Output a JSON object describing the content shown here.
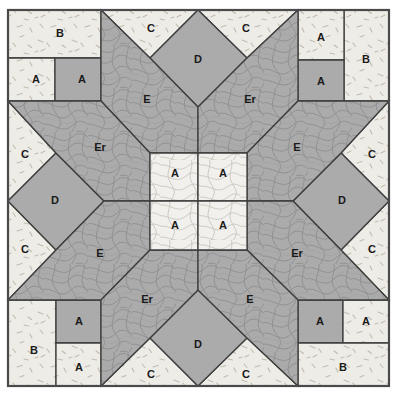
{
  "diagram": {
    "type": "quilt-block",
    "symmetry": "4-fold rotational",
    "canvas": {
      "width": 400,
      "height": 400,
      "background": "#ffffff"
    },
    "frame": {
      "x": 7,
      "y": 9,
      "width": 383,
      "height": 378,
      "border_color": "#4a4a4a",
      "border_width": 2
    },
    "palette": {
      "light_fleck": "#eceae4",
      "light_swirl": "#efefef",
      "medium_gray": "#ababab",
      "gray_swirl": "#a9a9a9",
      "seam_line": "#3d3d3d",
      "label_color": "#1a1a1a"
    },
    "legend": {
      "A": "small square",
      "B": "rectangle",
      "C": "corner triangle",
      "D": "edge diamond",
      "E": "star kite",
      "Er": "star kite reversed"
    }
  },
  "pieces": [
    {
      "id": "c1-b",
      "label": "B",
      "fabric": "light_fleck",
      "unit": "corner-top-left",
      "lx": 60,
      "ly": 34
    },
    {
      "id": "c1-a1",
      "label": "A",
      "fabric": "light_fleck",
      "unit": "corner-top-left",
      "lx": 36,
      "ly": 80
    },
    {
      "id": "c1-a2",
      "label": "A",
      "fabric": "medium_gray",
      "unit": "corner-top-left",
      "lx": 82,
      "ly": 80
    },
    {
      "id": "c2-a1",
      "label": "A",
      "fabric": "light_fleck",
      "unit": "corner-top-right",
      "lx": 321,
      "ly": 38
    },
    {
      "id": "c2-a2",
      "label": "A",
      "fabric": "medium_gray",
      "unit": "corner-top-right",
      "lx": 321,
      "ly": 82
    },
    {
      "id": "c2-b",
      "label": "B",
      "fabric": "light_fleck",
      "unit": "corner-top-right",
      "lx": 366,
      "ly": 60
    },
    {
      "id": "c3-b",
      "label": "B",
      "fabric": "light_fleck",
      "unit": "corner-bottom-left",
      "lx": 34,
      "ly": 351
    },
    {
      "id": "c3-a1",
      "label": "A",
      "fabric": "medium_gray",
      "unit": "corner-bottom-left",
      "lx": 79,
      "ly": 322
    },
    {
      "id": "c3-a2",
      "label": "A",
      "fabric": "light_fleck",
      "unit": "corner-bottom-left",
      "lx": 79,
      "ly": 368
    },
    {
      "id": "c4-a1",
      "label": "A",
      "fabric": "medium_gray",
      "unit": "corner-bottom-right",
      "lx": 320,
      "ly": 322
    },
    {
      "id": "c4-a2",
      "label": "A",
      "fabric": "light_fleck",
      "unit": "corner-bottom-right",
      "lx": 366,
      "ly": 322
    },
    {
      "id": "c4-b",
      "label": "B",
      "fabric": "light_fleck",
      "unit": "corner-bottom-right",
      "lx": 343,
      "ly": 368
    },
    {
      "id": "ct-l",
      "label": "C",
      "fabric": "light_fleck",
      "unit": "edge-top",
      "lx": 151,
      "ly": 29
    },
    {
      "id": "ct-r",
      "label": "C",
      "fabric": "light_fleck",
      "unit": "edge-top",
      "lx": 246,
      "ly": 29
    },
    {
      "id": "d-top",
      "label": "D",
      "fabric": "medium_gray",
      "unit": "edge-top",
      "lx": 198,
      "ly": 60
    },
    {
      "id": "cl-t",
      "label": "C",
      "fabric": "light_fleck",
      "unit": "edge-left",
      "lx": 25,
      "ly": 155
    },
    {
      "id": "cl-b",
      "label": "C",
      "fabric": "light_fleck",
      "unit": "edge-left",
      "lx": 25,
      "ly": 250
    },
    {
      "id": "d-left",
      "label": "D",
      "fabric": "medium_gray",
      "unit": "edge-left",
      "lx": 55,
      "ly": 201
    },
    {
      "id": "cr-t",
      "label": "C",
      "fabric": "light_fleck",
      "unit": "edge-right",
      "lx": 372,
      "ly": 155
    },
    {
      "id": "cr-b",
      "label": "C",
      "fabric": "light_fleck",
      "unit": "edge-right",
      "lx": 372,
      "ly": 250
    },
    {
      "id": "d-right",
      "label": "D",
      "fabric": "medium_gray",
      "unit": "edge-right",
      "lx": 342,
      "ly": 201
    },
    {
      "id": "cb-l",
      "label": "C",
      "fabric": "light_fleck",
      "unit": "edge-bottom",
      "lx": 151,
      "ly": 375
    },
    {
      "id": "cb-r",
      "label": "C",
      "fabric": "light_fleck",
      "unit": "edge-bottom",
      "lx": 246,
      "ly": 375
    },
    {
      "id": "d-bot",
      "label": "D",
      "fabric": "medium_gray",
      "unit": "edge-bottom",
      "lx": 198,
      "ly": 345
    },
    {
      "id": "e-tl",
      "label": "E",
      "fabric": "gray_swirl",
      "unit": "star-point",
      "lx": 147,
      "ly": 100
    },
    {
      "id": "er-tr",
      "label": "Er",
      "fabric": "gray_swirl",
      "unit": "star-point",
      "lx": 250,
      "ly": 100
    },
    {
      "id": "er-lt",
      "label": "Er",
      "fabric": "gray_swirl",
      "unit": "star-point",
      "lx": 100,
      "ly": 148
    },
    {
      "id": "e-rt",
      "label": "E",
      "fabric": "gray_swirl",
      "unit": "star-point",
      "lx": 297,
      "ly": 148
    },
    {
      "id": "e-lb",
      "label": "E",
      "fabric": "gray_swirl",
      "unit": "star-point",
      "lx": 100,
      "ly": 254
    },
    {
      "id": "er-rb",
      "label": "Er",
      "fabric": "gray_swirl",
      "unit": "star-point",
      "lx": 297,
      "ly": 254
    },
    {
      "id": "er-bl",
      "label": "Er",
      "fabric": "gray_swirl",
      "unit": "star-point",
      "lx": 147,
      "ly": 300
    },
    {
      "id": "e-br",
      "label": "E",
      "fabric": "gray_swirl",
      "unit": "star-point",
      "lx": 250,
      "ly": 300
    },
    {
      "id": "ctr-a1",
      "label": "A",
      "fabric": "light_swirl",
      "unit": "center",
      "lx": 175,
      "ly": 174
    },
    {
      "id": "ctr-a2",
      "label": "A",
      "fabric": "light_swirl",
      "unit": "center",
      "lx": 223,
      "ly": 174
    },
    {
      "id": "ctr-a3",
      "label": "A",
      "fabric": "light_swirl",
      "unit": "center",
      "lx": 175,
      "ly": 226
    },
    {
      "id": "ctr-a4",
      "label": "A",
      "fabric": "light_swirl",
      "unit": "center",
      "lx": 223,
      "ly": 226
    }
  ]
}
